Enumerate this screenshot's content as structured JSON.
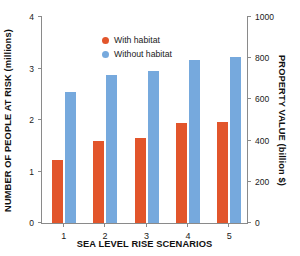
{
  "chart_data": {
    "type": "bar",
    "title": "",
    "xlabel": "SEA LEVEL RISE SCENARIOS",
    "ylabel": "NUMBER OF PEOPLE AT RISK (millions)",
    "y2label": "PROPERTY VALUE (billion $)",
    "categories": [
      "1",
      "2",
      "3",
      "4",
      "5"
    ],
    "series": [
      {
        "name": "With habitat",
        "color": "#e2552b",
        "values": [
          1.23,
          1.6,
          1.66,
          1.94,
          1.97
        ]
      },
      {
        "name": "Without habitat",
        "color": "#76a9dd",
        "values": [
          2.54,
          2.88,
          2.95,
          3.17,
          3.23
        ]
      }
    ],
    "ylim": [
      0,
      4
    ],
    "yticks": [
      0,
      1,
      2,
      3,
      4
    ],
    "ytick_labels": [
      "0",
      "1",
      "2",
      "3",
      "4"
    ],
    "y2lim": [
      0,
      1000
    ],
    "y2ticks": [
      0,
      200,
      400,
      600,
      800,
      1000
    ],
    "y2tick_labels": [
      "0",
      "200",
      "400",
      "600",
      "800",
      "1000"
    ],
    "grid": false,
    "legend_position": "top-left",
    "axis_color": "#8a8a8a",
    "text_color": "#1a1a1a",
    "background": "#ffffff"
  }
}
